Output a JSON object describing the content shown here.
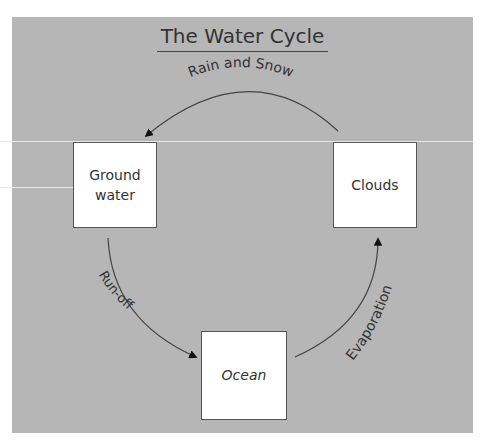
{
  "title": "The Water Cycle",
  "nodes": {
    "ground_water": "Ground\nwater",
    "clouds": "Clouds",
    "ocean": "Ocean"
  },
  "edges": [
    {
      "from": "Clouds",
      "to": "Ground water",
      "label": "Rain and Snow"
    },
    {
      "from": "Ground water",
      "to": "Ocean",
      "label": "Run-off"
    },
    {
      "from": "Ocean",
      "to": "Clouds",
      "label": "Evaporation"
    }
  ],
  "labels": {
    "rain": "Rain and Snow",
    "runoff": "Run-off",
    "evap": "Evaporation"
  },
  "colors": {
    "background": "#b6b6b6",
    "box_fill": "#ffffff",
    "line": "#333333"
  }
}
